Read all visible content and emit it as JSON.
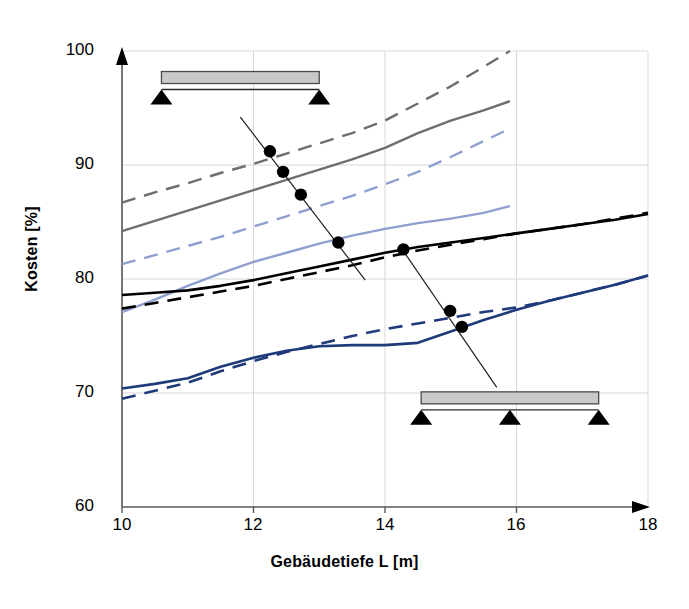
{
  "chart_data": {
    "type": "line",
    "title": "",
    "xlabel": "Gebäudetiefe L [m]",
    "ylabel": "Kosten [%]",
    "xlim": [
      10,
      18
    ],
    "ylim": [
      60,
      100
    ],
    "xticks": [
      "10",
      "12",
      "14",
      "16",
      "18"
    ],
    "yticks": [
      "60",
      "70",
      "80",
      "90",
      "100"
    ],
    "grid": true,
    "legend": "none",
    "series": [
      {
        "name": "grau gestrichelt",
        "color": "#6e6e6e",
        "style": "dashed",
        "x": [
          10.0,
          10.5,
          11.0,
          11.5,
          12.0,
          12.5,
          13.0,
          13.5,
          14.0,
          14.5,
          15.0,
          15.5,
          15.9
        ],
        "values": [
          86.7,
          87.6,
          88.4,
          89.3,
          90.1,
          91.0,
          91.9,
          92.8,
          93.9,
          95.4,
          96.9,
          98.6,
          100.0
        ]
      },
      {
        "name": "grau durchgezogen",
        "color": "#6e6e6e",
        "style": "solid",
        "x": [
          10.0,
          10.5,
          11.0,
          11.5,
          12.0,
          12.5,
          13.0,
          13.5,
          14.0,
          14.5,
          15.0,
          15.5,
          15.9
        ],
        "values": [
          84.2,
          85.1,
          86.0,
          86.9,
          87.8,
          88.7,
          89.6,
          90.5,
          91.5,
          92.8,
          93.9,
          94.8,
          95.6
        ]
      },
      {
        "name": "hellblau gestrichelt",
        "color": "#8e9fd0",
        "style": "dashed",
        "x": [
          10.0,
          10.5,
          11.0,
          11.5,
          12.0,
          12.5,
          13.0,
          13.5,
          14.0,
          14.5,
          15.0,
          15.5,
          15.9
        ],
        "values": [
          81.3,
          82.1,
          82.9,
          83.7,
          84.6,
          85.5,
          86.4,
          87.3,
          88.3,
          89.4,
          90.7,
          92.1,
          93.2
        ]
      },
      {
        "name": "hellblau durchgezogen",
        "color": "#8e9fd0",
        "style": "solid",
        "x": [
          10.0,
          10.5,
          11.0,
          11.5,
          12.0,
          12.5,
          13.0,
          13.5,
          14.0,
          14.5,
          15.0,
          15.5,
          15.9
        ],
        "values": [
          77.1,
          78.2,
          79.4,
          80.5,
          81.5,
          82.3,
          83.1,
          83.8,
          84.4,
          84.9,
          85.3,
          85.8,
          86.4
        ]
      },
      {
        "name": "schwarz durchgezogen",
        "color": "#000000",
        "style": "solid",
        "x": [
          10.0,
          10.5,
          11.0,
          11.5,
          12.0,
          12.5,
          13.0,
          13.5,
          14.0,
          14.5,
          15.0,
          15.5,
          16.0,
          16.5,
          17.0,
          17.5,
          18.0
        ],
        "values": [
          78.6,
          78.8,
          79.0,
          79.4,
          79.9,
          80.5,
          81.1,
          81.7,
          82.3,
          82.8,
          83.2,
          83.6,
          84.0,
          84.4,
          84.8,
          85.2,
          85.7
        ]
      },
      {
        "name": "schwarz gestrichelt",
        "color": "#000000",
        "style": "dashed",
        "x": [
          10.0,
          10.5,
          11.0,
          11.5,
          12.0,
          12.5,
          13.0,
          13.5,
          14.0,
          14.5,
          15.0,
          15.5,
          16.0,
          16.5,
          17.0,
          17.5,
          18.0
        ],
        "values": [
          77.4,
          77.9,
          78.4,
          78.9,
          79.4,
          80.0,
          80.6,
          81.2,
          81.9,
          82.5,
          83.0,
          83.5,
          84.0,
          84.4,
          84.8,
          85.3,
          85.8
        ]
      },
      {
        "name": "dunkelblau durchgezogen",
        "color": "#1f3a7a",
        "style": "solid",
        "x": [
          10.0,
          10.5,
          11.0,
          11.5,
          12.0,
          12.5,
          13.0,
          13.5,
          14.0,
          14.5,
          15.0,
          15.5,
          16.0,
          16.5,
          17.0,
          17.5,
          18.0
        ],
        "values": [
          70.4,
          70.8,
          71.3,
          72.3,
          73.1,
          73.7,
          74.1,
          74.2,
          74.2,
          74.4,
          75.4,
          76.4,
          77.3,
          78.1,
          78.8,
          79.5,
          80.3
        ]
      },
      {
        "name": "dunkelblau gestrichelt",
        "color": "#1f3a7a",
        "style": "dashed",
        "x": [
          10.0,
          10.5,
          11.0,
          11.5,
          12.0,
          12.5,
          13.0,
          13.5,
          14.0,
          14.5,
          15.0,
          15.5,
          16.0,
          16.5,
          17.0,
          17.5,
          18.0
        ],
        "values": [
          69.5,
          70.2,
          70.9,
          71.9,
          72.8,
          73.6,
          74.3,
          75.0,
          75.6,
          76.1,
          76.6,
          77.1,
          77.5,
          78.1,
          78.8,
          79.5,
          80.3
        ]
      }
    ],
    "annotations": [
      {
        "name": "leader-line-upper",
        "type": "leader-line",
        "from": [
          11.8,
          94.2
        ],
        "to": [
          13.7,
          79.9
        ],
        "markers": [
          {
            "x": 12.25,
            "y": 91.2
          },
          {
            "x": 12.45,
            "y": 89.4
          },
          {
            "x": 12.72,
            "y": 87.4
          },
          {
            "x": 13.29,
            "y": 83.2
          }
        ]
      },
      {
        "name": "leader-line-lower",
        "type": "leader-line",
        "from": [
          14.25,
          82.7
        ],
        "to": [
          15.7,
          70.5
        ],
        "markers": [
          {
            "x": 14.28,
            "y": 82.6
          },
          {
            "x": 14.99,
            "y": 77.2
          },
          {
            "x": 15.17,
            "y": 75.8
          }
        ]
      },
      {
        "name": "beam-diagram-two-supports",
        "type": "beam",
        "supports": 2,
        "x_left": 10.6,
        "x_right": 13.0,
        "y_top": 98.2
      },
      {
        "name": "beam-diagram-three-supports",
        "type": "beam",
        "supports": 3,
        "x_left": 14.55,
        "x_right": 17.25,
        "y_top": 70.1
      }
    ]
  },
  "axis": {
    "ylabel": "Kosten [%]",
    "xlabel": "Gebäudetiefe L [m]",
    "yticks": [
      "100",
      "90",
      "80",
      "70",
      "60"
    ],
    "xticks": [
      "10",
      "12",
      "14",
      "16",
      "18"
    ]
  },
  "colors": {
    "grey_series": "#6e6e6e",
    "light_blue_series": "#8e9fd0",
    "black_series": "#000000",
    "dark_blue_series": "#1f3a7a",
    "grid": "#d8d8d8",
    "axis": "#595959",
    "beam_fill": "#c9c9c9",
    "beam_stroke": "#4a4a4a"
  }
}
